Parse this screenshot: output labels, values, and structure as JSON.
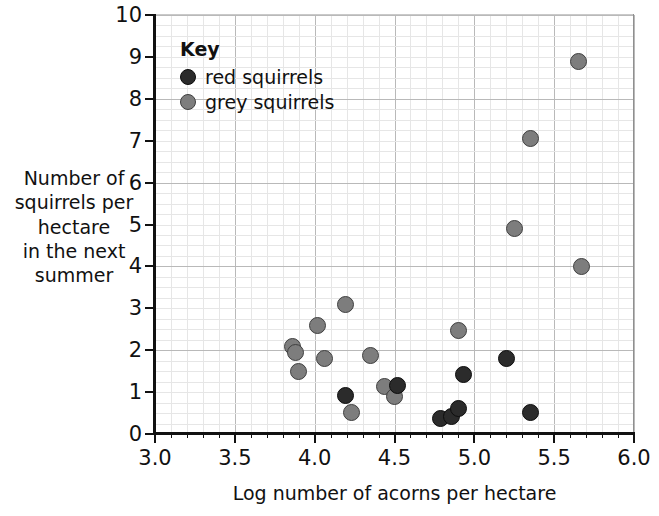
{
  "chart_data": {
    "type": "scatter",
    "title": "",
    "xlabel": "Log number of acorns per hectare",
    "ylabel": "Number of squirrels per hectare in the next summer",
    "ylabel_lines": [
      "Number of",
      "squirrels per",
      "hectare",
      "in the next",
      "summer"
    ],
    "xlim": [
      3.0,
      6.0
    ],
    "ylim": [
      0,
      10
    ],
    "xticks": [
      "3.0",
      "3.5",
      "4.0",
      "4.5",
      "5.0",
      "5.5",
      "6.0"
    ],
    "xtick_values": [
      3.0,
      3.5,
      4.0,
      4.5,
      5.0,
      5.5,
      6.0
    ],
    "yticks": [
      "0",
      "1",
      "2",
      "3",
      "4",
      "5",
      "6",
      "7",
      "8",
      "9",
      "10"
    ],
    "ytick_values": [
      0,
      1,
      2,
      3,
      4,
      5,
      6,
      7,
      8,
      9,
      10
    ],
    "grid": true,
    "grid_major_color": "#b9b9b9",
    "grid_minor_color": "#e6e6e6",
    "legend_title": "Key",
    "legend_position": "top-left-inside",
    "series": [
      {
        "name": "red squirrels",
        "color": "#2b2b2b",
        "marker": "circle",
        "points": [
          [
            4.19,
            0.92
          ],
          [
            4.52,
            1.15
          ],
          [
            4.79,
            0.36
          ],
          [
            4.86,
            0.42
          ],
          [
            4.9,
            0.62
          ],
          [
            4.93,
            1.42
          ],
          [
            5.2,
            1.8
          ],
          [
            5.35,
            0.52
          ]
        ]
      },
      {
        "name": "grey squirrels",
        "color": "#7d7d7d",
        "marker": "circle",
        "points": [
          [
            3.86,
            2.08
          ],
          [
            3.88,
            1.95
          ],
          [
            3.9,
            1.5
          ],
          [
            4.02,
            2.6
          ],
          [
            4.06,
            1.8
          ],
          [
            4.19,
            3.1
          ],
          [
            4.23,
            0.52
          ],
          [
            4.35,
            1.88
          ],
          [
            4.44,
            1.13
          ],
          [
            4.5,
            0.9
          ],
          [
            4.9,
            2.48
          ],
          [
            5.25,
            4.9
          ],
          [
            5.35,
            7.05
          ],
          [
            5.65,
            8.9
          ],
          [
            5.67,
            4.0
          ]
        ]
      }
    ]
  },
  "legend": {
    "title": "Key",
    "entries": [
      {
        "label": "red squirrels",
        "color": "#2b2b2b",
        "kind": "red"
      },
      {
        "label": "grey squirrels",
        "color": "#7d7d7d",
        "kind": "grey"
      }
    ]
  }
}
